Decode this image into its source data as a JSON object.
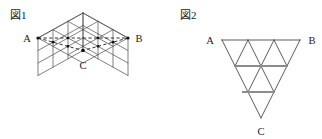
{
  "figures": [
    {
      "id": "figure-1",
      "caption": "図1",
      "caption_pos": {
        "x": 10,
        "y": 19
      },
      "type": "isometric-cube-3x3x3",
      "description": "3x3x3 cube drawn in isometric projection with dashed triangle A-B-C marked on three faces",
      "vertices": [
        {
          "name": "A",
          "label": "A",
          "x": 38,
          "y": 38,
          "label_x": 25,
          "label_y": 41
        },
        {
          "name": "B",
          "label": "B",
          "x": 128,
          "y": 38,
          "label_x": 133,
          "label_y": 41
        },
        {
          "name": "C",
          "label": "C",
          "x": 83,
          "y": 113,
          "label_x": 79,
          "label_y": 133
        }
      ],
      "cube": {
        "cell": 15,
        "n": 3,
        "top_apex": {
          "x": 83,
          "y": 13
        },
        "dx": 15,
        "dy": 8.333,
        "depth_y": 12.5,
        "stroke": "#4a4a4a",
        "stroke_width": 0.7
      },
      "dashed_edges": [
        {
          "from": "A",
          "to": "B",
          "style": "dashed"
        },
        {
          "from": "A",
          "to": "C",
          "style": "dashed"
        },
        {
          "from": "B",
          "to": "C",
          "style": "dashed"
        }
      ],
      "dashed_stroke": "#1a1a1a",
      "marker_dots": 3
    },
    {
      "id": "figure-2",
      "caption": "図2",
      "caption_pos": {
        "x": 180,
        "y": 19
      },
      "type": "inverted-triangle-grid",
      "description": "Downward-pointing triangle ABC subdivided into 9 small triangles (3 rows), two horizontal segments highlighted in grey",
      "vertices": [
        {
          "name": "A",
          "label": "A",
          "x": 222,
          "y": 40,
          "label_x": 208,
          "label_y": 44
        },
        {
          "name": "B",
          "label": "B",
          "x": 300,
          "y": 40,
          "label_x": 304,
          "label_y": 44
        },
        {
          "name": "C",
          "label": "C",
          "x": 261,
          "y": 118,
          "label_x": 257,
          "label_y": 135
        }
      ],
      "rows": 3,
      "stroke": "#4a4a4a",
      "stroke_width": 0.9,
      "highlight_stroke": "#8c8c8c",
      "highlight_stroke_width": 2.0,
      "highlight_segments": [
        {
          "row": 1,
          "from_x": 235,
          "to_x": 287,
          "y": 66
        },
        {
          "row": 2,
          "from_x": 242,
          "to_x": 274,
          "y": 92
        }
      ]
    }
  ],
  "colors": {
    "ink": "#1a1a1a",
    "line": "#4a4a4a",
    "highlight": "#8c8c8c",
    "background": "#ffffff"
  }
}
